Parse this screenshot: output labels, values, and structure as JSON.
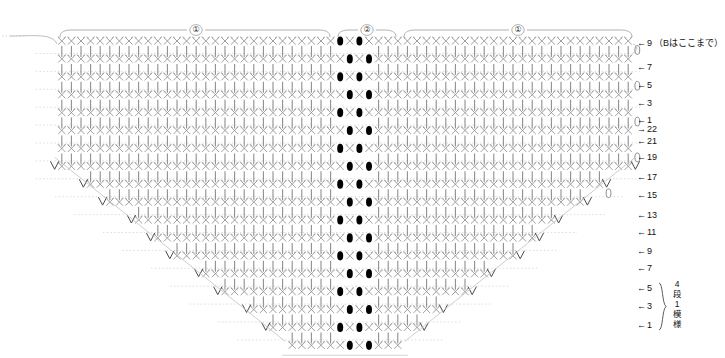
{
  "chart_data": {
    "type": "diagram",
    "title": "",
    "notation": "japanese-crochet-symbol-chart",
    "grid": {
      "stitch_width": 9.6,
      "row_height": 17.9,
      "left_edge_x": 57,
      "right_edge_x": 633,
      "top_row_y": 41,
      "bottom_row_y": 338,
      "total_stitch_columns": 60,
      "center_column_index": 30
    },
    "symbol_legend": [
      {
        "key": "x",
        "name": "single-crochet-x",
        "glyph": "×",
        "fill": "#8a8a8a"
      },
      {
        "key": "filled",
        "name": "puff-stitch-filled-oval",
        "glyph": "●",
        "fill": "#000000"
      },
      {
        "key": "chain",
        "name": "turning-chain-loop",
        "glyph": "○",
        "fill": "none"
      },
      {
        "key": "decrease",
        "name": "decrease-two-together",
        "glyph": "∨",
        "fill": "#555555"
      },
      {
        "key": "post",
        "name": "long-post-stitch-bar",
        "glyph": "│",
        "fill": "#9a9a9a"
      }
    ],
    "brackets": [
      {
        "id": "left-repeat",
        "label": "①",
        "x_start": 60,
        "x_end": 330,
        "label_x": 196
      },
      {
        "id": "center-panel",
        "label": "②",
        "x_start": 338,
        "x_end": 396,
        "label_x": 367
      },
      {
        "id": "right-repeat",
        "label": "①",
        "x_start": 404,
        "x_end": 632,
        "label_x": 518
      }
    ],
    "row_labels": [
      {
        "num": "9",
        "arrow": "←",
        "y": 44,
        "note": "（Bはここまで）"
      },
      {
        "num": "7",
        "arrow": "←",
        "y": 68,
        "note": ""
      },
      {
        "num": "5",
        "arrow": "←",
        "y": 86,
        "note": ""
      },
      {
        "num": "3",
        "arrow": "←",
        "y": 104,
        "note": ""
      },
      {
        "num": "1",
        "arrow": "←",
        "y": 121,
        "note": ""
      },
      {
        "num": "22",
        "arrow": "→",
        "y": 130,
        "note": ""
      },
      {
        "num": "21",
        "arrow": "←",
        "y": 142,
        "note": ""
      },
      {
        "num": "19",
        "arrow": "←",
        "y": 158,
        "note": ""
      },
      {
        "num": "17",
        "arrow": "←",
        "y": 178,
        "note": ""
      },
      {
        "num": "15",
        "arrow": "←",
        "y": 196,
        "note": ""
      },
      {
        "num": "13",
        "arrow": "←",
        "y": 216,
        "note": ""
      },
      {
        "num": "11",
        "arrow": "←",
        "y": 233,
        "note": ""
      },
      {
        "num": "9",
        "arrow": "←",
        "y": 252,
        "note": ""
      },
      {
        "num": "7",
        "arrow": "←",
        "y": 269,
        "note": ""
      },
      {
        "num": "5",
        "arrow": "←",
        "y": 289,
        "note": ""
      },
      {
        "num": "3",
        "arrow": "←",
        "y": 307,
        "note": ""
      },
      {
        "num": "1",
        "arrow": "←",
        "y": 326,
        "note": ""
      }
    ],
    "repeat_annotation": {
      "lines": [
        "4",
        "段",
        "1",
        "模",
        "様"
      ],
      "text": "4段1模様",
      "brace_top_y": 283,
      "brace_bottom_y": 330
    },
    "shape": {
      "description": "trapezoid-with-central-vertical-panel",
      "full_width_rows_top": 7,
      "tapered_rows": 10,
      "narrow_rows_bottom": 1,
      "taper_left_slope_per_row": 23,
      "taper_right_slope_per_row": 23
    },
    "colors": {
      "stitch_gray": "#8f8f8f",
      "stitch_dark": "#000000",
      "guide_line": "#cfcfcf",
      "bracket_line": "#a8a8a8",
      "text": "#111111",
      "background": "#ffffff"
    }
  }
}
